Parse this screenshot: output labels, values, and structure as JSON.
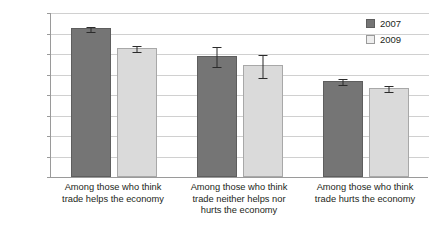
{
  "chart_data": {
    "type": "bar",
    "title": "",
    "xlabel": "",
    "ylabel": "",
    "ylim": [
      0.0,
      0.8
    ],
    "ytick_labels": [
      "0.8",
      "0.7",
      "0.6",
      "0.5",
      "0.4",
      "0.3",
      "0.2",
      "0.1",
      "0.0"
    ],
    "ytick_values": [
      0.8,
      0.7,
      0.6,
      0.5,
      0.4,
      0.3,
      0.2,
      0.1,
      0.0
    ],
    "grid": true,
    "legend_position": "top-right",
    "categories": [
      "Among those who think trade helps the economy",
      "Among those who think trade neither helps nor hurts the economy",
      "Among those who think trade hurts the economy"
    ],
    "category_lines": [
      [
        "Among those who think",
        "trade helps the economy"
      ],
      [
        "Among those who think",
        "trade neither helps nor",
        "hurts the economy"
      ],
      [
        "Among those who think",
        "trade hurts the economy"
      ]
    ],
    "series": [
      {
        "name": "2007",
        "color": "#757575",
        "values": [
          0.725,
          0.59,
          0.468
        ],
        "errors": [
          0.012,
          0.05,
          0.016
        ]
      },
      {
        "name": "2009",
        "color": "#dadada",
        "values": [
          0.628,
          0.545,
          0.435
        ],
        "errors": [
          0.014,
          0.055,
          0.014
        ]
      }
    ]
  },
  "legend": {
    "entries": [
      {
        "label": "2007"
      },
      {
        "label": "2009"
      }
    ]
  }
}
